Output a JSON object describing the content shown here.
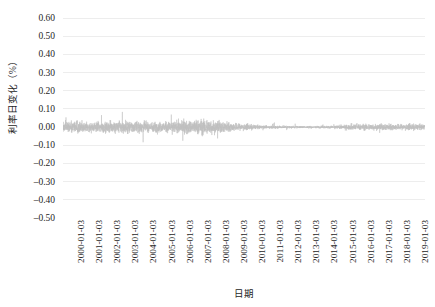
{
  "chart_data": {
    "type": "line",
    "title": "",
    "xlabel": "日期",
    "ylabel": "利率日变化（%）",
    "grid": true,
    "legend": false,
    "line_color": "#bfbfbf",
    "gridline_color": "#ededed",
    "background_color": "#ffffff",
    "ylim": [
      -0.5,
      0.6
    ],
    "ytick_labels": [
      "0.60",
      "0.50",
      "0.40",
      "0.30",
      "0.20",
      "0.10",
      "0.00",
      "-0.10",
      "-0.20",
      "-0.30",
      "-0.40",
      "-0.50"
    ],
    "ytick_values": [
      0.6,
      0.5,
      0.4,
      0.3,
      0.2,
      0.1,
      0.0,
      -0.1,
      -0.2,
      -0.3,
      -0.4,
      -0.5
    ],
    "xtick_labels": [
      "2000-01-03",
      "2001-01-03",
      "2002-01-03",
      "2003-01-03",
      "2004-01-03",
      "2005-01-03",
      "2006-01-03",
      "2007-01-03",
      "2008-01-03",
      "2009-01-03",
      "2010-01-03",
      "2011-01-03",
      "2012-01-03",
      "2013-01-03",
      "2014-01-03",
      "2015-01-03",
      "2016-01-03",
      "2017-01-03",
      "2018-01-03",
      "2019-01-03"
    ],
    "x_range": [
      "2000-01-03",
      "2019-12-31"
    ],
    "series_name": "利率日变化",
    "annual_volatility_profile": [
      {
        "year": 2000,
        "mean": 0.0,
        "amplitude": 0.035,
        "max": 0.075,
        "min": -0.085
      },
      {
        "year": 2001,
        "mean": 0.0,
        "amplitude": 0.032,
        "max": 0.07,
        "min": -0.09
      },
      {
        "year": 2002,
        "mean": 0.0,
        "amplitude": 0.03,
        "max": 0.065,
        "min": -0.075
      },
      {
        "year": 2003,
        "mean": 0.0,
        "amplitude": 0.038,
        "max": 0.085,
        "min": -0.11
      },
      {
        "year": 2004,
        "mean": 0.0,
        "amplitude": 0.034,
        "max": 0.08,
        "min": -0.095
      },
      {
        "year": 2005,
        "mean": 0.0,
        "amplitude": 0.03,
        "max": 0.07,
        "min": -0.08
      },
      {
        "year": 2006,
        "mean": 0.0,
        "amplitude": 0.033,
        "max": 0.075,
        "min": -0.085
      },
      {
        "year": 2007,
        "mean": 0.0,
        "amplitude": 0.04,
        "max": 0.09,
        "min": -0.105
      },
      {
        "year": 2008,
        "mean": 0.0,
        "amplitude": 0.048,
        "max": 0.12,
        "min": -0.17
      },
      {
        "year": 2009,
        "mean": 0.0,
        "amplitude": 0.03,
        "max": 0.07,
        "min": -0.08
      },
      {
        "year": 2010,
        "mean": 0.0,
        "amplitude": 0.018,
        "max": 0.04,
        "min": -0.045
      },
      {
        "year": 2011,
        "mean": 0.0,
        "amplitude": 0.01,
        "max": 0.025,
        "min": -0.025
      },
      {
        "year": 2012,
        "mean": 0.0,
        "amplitude": 0.008,
        "max": 0.02,
        "min": -0.02
      },
      {
        "year": 2013,
        "mean": 0.0,
        "amplitude": 0.007,
        "max": 0.018,
        "min": -0.018
      },
      {
        "year": 2014,
        "mean": 0.0,
        "amplitude": 0.007,
        "max": 0.018,
        "min": -0.018
      },
      {
        "year": 2015,
        "mean": 0.0,
        "amplitude": 0.009,
        "max": 0.022,
        "min": -0.022
      },
      {
        "year": 2016,
        "mean": 0.0,
        "amplitude": 0.016,
        "max": 0.04,
        "min": -0.042
      },
      {
        "year": 2017,
        "mean": 0.0,
        "amplitude": 0.02,
        "max": 0.048,
        "min": -0.05
      },
      {
        "year": 2018,
        "mean": 0.0,
        "amplitude": 0.019,
        "max": 0.045,
        "min": -0.048
      },
      {
        "year": 2019,
        "mean": 0.0,
        "amplitude": 0.017,
        "max": 0.042,
        "min": -0.044
      }
    ]
  }
}
